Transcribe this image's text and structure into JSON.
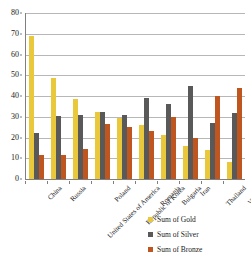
{
  "chart_data": {
    "type": "bar",
    "title": "",
    "subtitle": "",
    "xlabel": "",
    "ylabel": "",
    "ylim": [
      0,
      80
    ],
    "ytick_step": 10,
    "yticks": [
      80,
      70,
      60,
      50,
      40,
      30,
      20,
      10,
      0
    ],
    "grid": true,
    "grid_axis": "y",
    "legend_position": "bottom-right",
    "categories": [
      "China",
      "Russia",
      "United States of America",
      "Poland",
      "Republic of Korea",
      "Romania",
      "Bulgaria",
      "Iran",
      "Thailand",
      "Vietnam"
    ],
    "series": [
      {
        "name": "Sum of Gold",
        "color": "#E9C83B",
        "values": [
          69,
          48.5,
          38.5,
          32.5,
          29.5,
          26,
          21,
          16,
          14,
          8
        ]
      },
      {
        "name": "Sum of Silver",
        "color": "#595959",
        "values": [
          22,
          30.5,
          31,
          32.5,
          31,
          39,
          36,
          45,
          27,
          32
        ]
      },
      {
        "name": "Sum of Bronze",
        "color": "#C0561F",
        "values": [
          11.5,
          11.5,
          14.5,
          26.5,
          25,
          23,
          30,
          20,
          40,
          44
        ]
      }
    ]
  },
  "legend": {
    "items": [
      {
        "label": "Sum of Gold",
        "color": "#E9C83B",
        "icon": "legend-swatch-gold"
      },
      {
        "label": "Sum of Silver",
        "color": "#595959",
        "icon": "legend-swatch-silver"
      },
      {
        "label": "Sum of Bronze",
        "color": "#C0561F",
        "icon": "legend-swatch-bronze"
      }
    ]
  }
}
